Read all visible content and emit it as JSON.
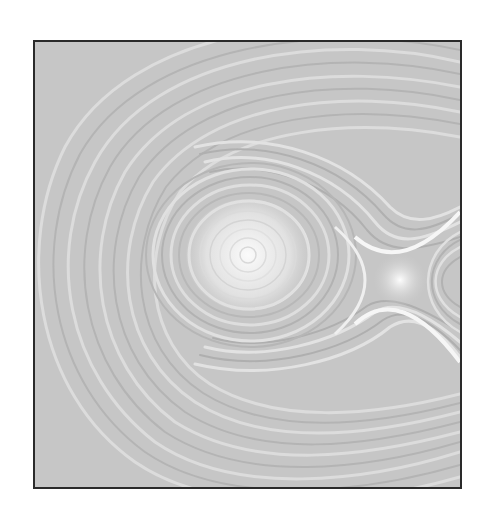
{
  "figure": {
    "type": "flow-field-visualization",
    "style": "line integral convolution (grayscale)",
    "frame": {
      "x": 33,
      "y": 40,
      "width": 427,
      "height": 447,
      "border_color": "#2a2a2a"
    },
    "colors": {
      "background": "#ffffff",
      "base_gray": "#c8c8c8",
      "dark_streak": "#a9a9a9",
      "light_streak": "#ececec",
      "highlight": "#fafafa"
    },
    "features": [
      {
        "kind": "vortex-center",
        "label": "center",
        "x": 246,
        "y": 253
      },
      {
        "kind": "saddle-point",
        "label": "saddle",
        "x": 398,
        "y": 278
      }
    ]
  }
}
